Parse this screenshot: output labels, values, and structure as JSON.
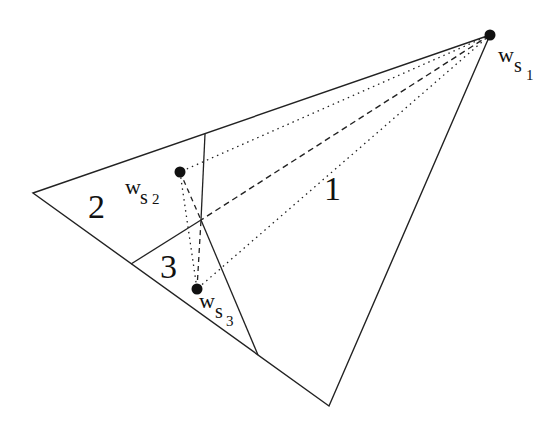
{
  "diagram": {
    "title": "",
    "regions": [
      {
        "id": "1",
        "label": "1"
      },
      {
        "id": "2",
        "label": "2"
      },
      {
        "id": "3",
        "label": "3"
      }
    ],
    "points": [
      {
        "id": "ws1",
        "base": "w",
        "sub": "s",
        "subsub": "1"
      },
      {
        "id": "ws2",
        "base": "w",
        "sub": "s",
        "subsub": "2"
      },
      {
        "id": "ws3",
        "base": "w",
        "sub": "s",
        "subsub": "3"
      }
    ],
    "colors": {
      "line": "#222222",
      "point": "#111111",
      "background": "#ffffff"
    }
  }
}
